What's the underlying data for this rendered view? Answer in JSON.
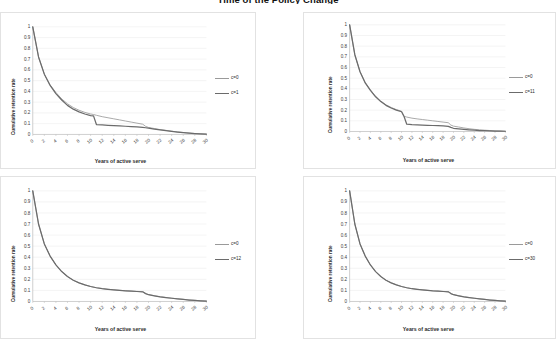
{
  "title": "Time of the Policy Change",
  "axis": {
    "ylabel": "Cumulative retention rate",
    "xlabel": "Years of active serve",
    "yticks": [
      "1",
      "0.9",
      "0.8",
      "0.7",
      "0.6",
      "0.5",
      "0.4",
      "0.3",
      "0.2",
      "0.1",
      "0"
    ],
    "xticks": [
      "0",
      "2",
      "4",
      "6",
      "8",
      "10",
      "12",
      "14",
      "16",
      "18",
      "20",
      "22",
      "24",
      "26",
      "28",
      "30"
    ]
  },
  "colors": {
    "series_baseline": "#9a9a9a",
    "series_policy": "#6b6b6b",
    "gridline": "#e8e8e8",
    "axisline": "#b9b9b9",
    "panel_border": "#e2e2e2",
    "background": "#ffffff"
  },
  "panels": [
    {
      "id": "panel-top-left",
      "legend": [
        "c=0",
        "c=1"
      ]
    },
    {
      "id": "panel-top-right",
      "legend": [
        "c=0",
        "c=11"
      ]
    },
    {
      "id": "panel-bottom-left",
      "legend": [
        "c=0",
        "c=12"
      ]
    },
    {
      "id": "panel-bottom-right",
      "legend": [
        "c=0",
        "c=30"
      ]
    }
  ],
  "chart_data": [
    {
      "type": "line",
      "title": "",
      "panel": "panel-top-left",
      "xlabel": "Years of active serve",
      "ylabel": "Cumulative retention rate",
      "xlim": [
        0,
        30
      ],
      "ylim": [
        0,
        1
      ],
      "grid": true,
      "legend_position": "right",
      "x": [
        0,
        1,
        2,
        3,
        4,
        5,
        6,
        7,
        8,
        9,
        10,
        10.5,
        11,
        12,
        13,
        14,
        15,
        16,
        17,
        18,
        19,
        19.5,
        20,
        21,
        22,
        23,
        24,
        25,
        26,
        27,
        28,
        29,
        30
      ],
      "series": [
        {
          "name": "c=0",
          "values": [
            1.0,
            0.72,
            0.56,
            0.46,
            0.39,
            0.33,
            0.285,
            0.25,
            0.225,
            0.205,
            0.19,
            0.185,
            0.178,
            0.165,
            0.155,
            0.145,
            0.135,
            0.125,
            0.115,
            0.105,
            0.095,
            0.075,
            0.065,
            0.055,
            0.045,
            0.038,
            0.03,
            0.024,
            0.018,
            0.013,
            0.009,
            0.005,
            0.002
          ]
        },
        {
          "name": "c=1",
          "values": [
            1.0,
            0.72,
            0.56,
            0.455,
            0.38,
            0.32,
            0.27,
            0.235,
            0.21,
            0.19,
            0.175,
            0.172,
            0.092,
            0.088,
            0.085,
            0.082,
            0.079,
            0.076,
            0.073,
            0.07,
            0.065,
            0.062,
            0.058,
            0.05,
            0.042,
            0.035,
            0.028,
            0.022,
            0.017,
            0.012,
            0.008,
            0.005,
            0.002
          ]
        }
      ]
    },
    {
      "type": "line",
      "title": "",
      "panel": "panel-top-right",
      "xlabel": "Years of active serve",
      "ylabel": "Cumulative retention rate",
      "xlim": [
        0,
        30
      ],
      "ylim": [
        0,
        1
      ],
      "grid": true,
      "legend_position": "right",
      "x": [
        0,
        1,
        2,
        3,
        4,
        5,
        6,
        7,
        8,
        9,
        10,
        10.5,
        11,
        12,
        13,
        14,
        15,
        16,
        17,
        18,
        19,
        19.5,
        20,
        21,
        22,
        23,
        24,
        25,
        26,
        27,
        28,
        29,
        30
      ],
      "series": [
        {
          "name": "c=0",
          "values": [
            1.0,
            0.72,
            0.56,
            0.46,
            0.39,
            0.33,
            0.285,
            0.25,
            0.225,
            0.205,
            0.19,
            0.142,
            0.135,
            0.125,
            0.118,
            0.112,
            0.106,
            0.1,
            0.094,
            0.088,
            0.082,
            0.06,
            0.05,
            0.042,
            0.033,
            0.026,
            0.02,
            0.016,
            0.012,
            0.009,
            0.006,
            0.004,
            0.002
          ]
        },
        {
          "name": "c=11",
          "values": [
            1.0,
            0.72,
            0.56,
            0.455,
            0.385,
            0.325,
            0.28,
            0.245,
            0.22,
            0.2,
            0.185,
            0.138,
            0.068,
            0.064,
            0.062,
            0.06,
            0.058,
            0.056,
            0.054,
            0.052,
            0.048,
            0.038,
            0.03,
            0.024,
            0.019,
            0.015,
            0.012,
            0.009,
            0.007,
            0.005,
            0.004,
            0.003,
            0.002
          ]
        }
      ]
    },
    {
      "type": "line",
      "title": "",
      "panel": "panel-bottom-left",
      "xlabel": "Years of active serve",
      "ylabel": "Cumulative retention rate",
      "xlim": [
        0,
        30
      ],
      "ylim": [
        0,
        1
      ],
      "grid": true,
      "legend_position": "right",
      "x": [
        0,
        1,
        2,
        3,
        4,
        5,
        6,
        7,
        8,
        9,
        10,
        11,
        12,
        13,
        14,
        15,
        16,
        17,
        18,
        19,
        19.5,
        20,
        21,
        22,
        23,
        24,
        25,
        26,
        27,
        28,
        29,
        30
      ],
      "series": [
        {
          "name": "c=0",
          "values": [
            1.0,
            0.7,
            0.52,
            0.41,
            0.33,
            0.27,
            0.225,
            0.192,
            0.168,
            0.15,
            0.135,
            0.124,
            0.116,
            0.11,
            0.105,
            0.101,
            0.097,
            0.094,
            0.091,
            0.088,
            0.072,
            0.062,
            0.052,
            0.043,
            0.036,
            0.03,
            0.024,
            0.019,
            0.014,
            0.01,
            0.006,
            0.003
          ]
        },
        {
          "name": "c=12",
          "values": [
            1.0,
            0.7,
            0.52,
            0.41,
            0.33,
            0.27,
            0.225,
            0.192,
            0.168,
            0.15,
            0.135,
            0.124,
            0.115,
            0.109,
            0.104,
            0.1,
            0.096,
            0.093,
            0.09,
            0.087,
            0.071,
            0.061,
            0.051,
            0.042,
            0.035,
            0.029,
            0.023,
            0.018,
            0.013,
            0.009,
            0.006,
            0.003
          ]
        }
      ]
    },
    {
      "type": "line",
      "title": "",
      "panel": "panel-bottom-right",
      "xlabel": "Years of active serve",
      "ylabel": "Cumulative retention rate",
      "xlim": [
        0,
        30
      ],
      "ylim": [
        0,
        1
      ],
      "grid": true,
      "legend_position": "right",
      "x": [
        0,
        1,
        2,
        3,
        4,
        5,
        6,
        7,
        8,
        9,
        10,
        11,
        12,
        13,
        14,
        15,
        16,
        17,
        18,
        19,
        19.5,
        20,
        21,
        22,
        23,
        24,
        25,
        26,
        27,
        28,
        29,
        30
      ],
      "series": [
        {
          "name": "c=0",
          "values": [
            1.0,
            0.7,
            0.52,
            0.41,
            0.33,
            0.27,
            0.225,
            0.192,
            0.168,
            0.15,
            0.135,
            0.124,
            0.116,
            0.11,
            0.105,
            0.101,
            0.097,
            0.094,
            0.091,
            0.088,
            0.072,
            0.062,
            0.052,
            0.043,
            0.036,
            0.03,
            0.024,
            0.019,
            0.014,
            0.01,
            0.006,
            0.003
          ]
        },
        {
          "name": "c=30",
          "values": [
            1.0,
            0.7,
            0.52,
            0.41,
            0.33,
            0.27,
            0.225,
            0.192,
            0.168,
            0.15,
            0.135,
            0.124,
            0.115,
            0.109,
            0.104,
            0.1,
            0.096,
            0.093,
            0.09,
            0.087,
            0.071,
            0.061,
            0.051,
            0.042,
            0.035,
            0.029,
            0.023,
            0.018,
            0.013,
            0.009,
            0.006,
            0.003
          ]
        }
      ]
    }
  ]
}
